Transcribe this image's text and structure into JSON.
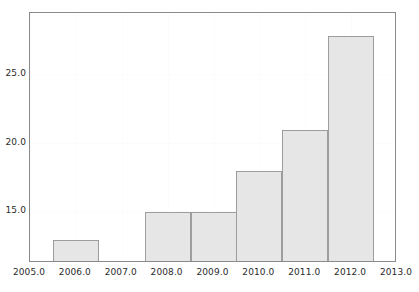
{
  "chart_data": {
    "type": "bar",
    "title": "",
    "subtitle": "",
    "xlabel": "",
    "ylabel": "",
    "categories": [
      "2006.0",
      "2007.0",
      "2008.0",
      "2009.0",
      "2010.0",
      "2011.0",
      "2012.0"
    ],
    "x": [
      2006,
      2007,
      2008,
      2009,
      2010,
      2011,
      2012
    ],
    "values": [
      12.9,
      0,
      14.9,
      14.9,
      17.9,
      20.9,
      27.8
    ],
    "bars": [
      {
        "category": "2006.0",
        "x": 2006,
        "value": 12.9
      },
      {
        "category": "2007.0",
        "x": 2007,
        "value": 0
      },
      {
        "category": "2008.0",
        "x": 2008,
        "value": 14.9
      },
      {
        "category": "2009.0",
        "x": 2009,
        "value": 14.9
      },
      {
        "category": "2010.0",
        "x": 2010,
        "value": 17.9
      },
      {
        "category": "2011.0",
        "x": 2011,
        "value": 20.9
      },
      {
        "category": "2012.0",
        "x": 2012,
        "value": 27.8
      }
    ],
    "xlim": [
      2005.0,
      2013.0
    ],
    "ylim": [
      11.2,
      29.5
    ],
    "xticks": [
      2005.0,
      2006.0,
      2007.0,
      2008.0,
      2009.0,
      2010.0,
      2011.0,
      2012.0,
      2013.0
    ],
    "xtick_labels": [
      "2005.0",
      "2006.0",
      "2007.0",
      "2008.0",
      "2009.0",
      "2010.0",
      "2011.0",
      "2012.0",
      "2013.0"
    ],
    "yticks": [
      15.0,
      20.0,
      25.0
    ],
    "ytick_labels": [
      "15.0",
      "20.0",
      "25.0"
    ],
    "bar_width": 1.0,
    "grid": true,
    "legend": null,
    "legend_position": "none",
    "annotations": [],
    "colors": {
      "bar_fill": "#e6e6e6",
      "bar_border": "#9d9d9d",
      "axis_frame": "#8a8a8a",
      "grid": "#fcfcfc",
      "text": "#2b2b2b",
      "background": "#ffffff"
    }
  }
}
